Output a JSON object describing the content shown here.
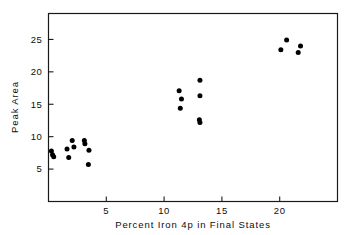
{
  "chart_data": {
    "type": "scatter",
    "title": "",
    "xlabel": "Percent Iron 4p in Final States",
    "ylabel": "Peak Area",
    "xlim": [
      0,
      25
    ],
    "ylim": [
      0,
      29
    ],
    "grid": false,
    "legend": "none",
    "marker": "filled-circle",
    "marker_color": "#000000",
    "xticks": [
      5,
      10,
      15,
      20
    ],
    "xtick_labels": [
      "5",
      "10",
      "15",
      "20"
    ],
    "yticks": [
      5,
      10,
      15,
      20,
      25
    ],
    "ytick_labels": [
      "5",
      "10",
      "15",
      "20",
      "25"
    ],
    "points": [
      {
        "x": 0.25,
        "y": 7.8
      },
      {
        "x": 0.35,
        "y": 7.2
      },
      {
        "x": 0.45,
        "y": 6.9
      },
      {
        "x": 1.6,
        "y": 8.1
      },
      {
        "x": 1.75,
        "y": 6.8
      },
      {
        "x": 2.05,
        "y": 9.4
      },
      {
        "x": 2.2,
        "y": 8.4
      },
      {
        "x": 3.1,
        "y": 9.4
      },
      {
        "x": 3.15,
        "y": 8.9
      },
      {
        "x": 3.5,
        "y": 7.9
      },
      {
        "x": 3.45,
        "y": 5.7
      },
      {
        "x": 11.3,
        "y": 17.1
      },
      {
        "x": 11.5,
        "y": 15.8
      },
      {
        "x": 11.4,
        "y": 14.4
      },
      {
        "x": 13.1,
        "y": 18.7
      },
      {
        "x": 13.1,
        "y": 16.3
      },
      {
        "x": 13.05,
        "y": 12.6
      },
      {
        "x": 13.1,
        "y": 12.2
      },
      {
        "x": 20.1,
        "y": 23.4
      },
      {
        "x": 20.6,
        "y": 24.9
      },
      {
        "x": 21.6,
        "y": 23.0
      },
      {
        "x": 21.8,
        "y": 24.0
      }
    ]
  }
}
